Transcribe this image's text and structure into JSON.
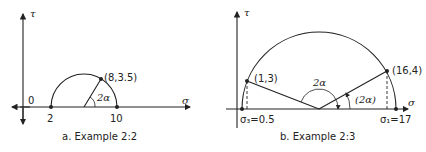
{
  "figure_a": {
    "caption": "a.  Example 2:2",
    "y_axis_label": "τ",
    "x_axis_label": "σ",
    "origin_label": "0",
    "left_point_label": "2",
    "right_point_label": "10",
    "point_label": "(8,3.5)",
    "angle_label": "2α"
  },
  "figure_b": {
    "caption": "b.  Example 2:3",
    "y_axis_label": "τ",
    "x_axis_label": "σ",
    "left_point_label": "(1,3)",
    "right_point_label": "(16,4)",
    "center_angle_label": "2α",
    "right_angle_label": "(2α)",
    "sigma3_label": "σ₃=0.5",
    "sigma1_label": "σ₁=17"
  }
}
